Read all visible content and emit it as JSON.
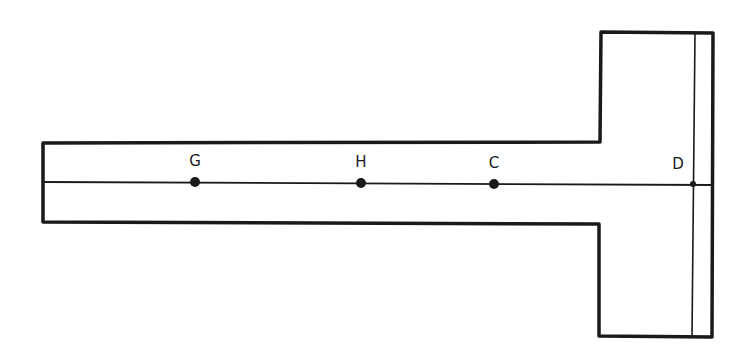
{
  "diagram": {
    "type": "T-shaped beam/bar schematic",
    "stroke_color": "#1a1a1a",
    "background": "#ffffff",
    "points": [
      {
        "id": "G",
        "label": "G",
        "x": 195,
        "y": 182,
        "dot": true
      },
      {
        "id": "H",
        "label": "H",
        "x": 361,
        "y": 183,
        "dot": true
      },
      {
        "id": "C",
        "label": "C",
        "x": 494,
        "y": 184,
        "dot": true
      },
      {
        "id": "D",
        "label": "D",
        "x": 693,
        "y": 184,
        "dot": true
      }
    ]
  }
}
